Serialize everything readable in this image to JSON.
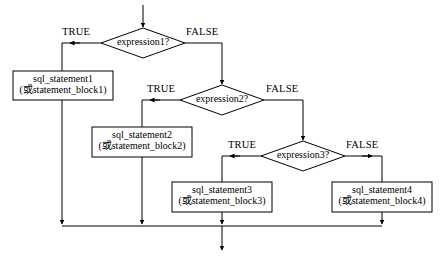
{
  "diagram": {
    "type": "flowchart",
    "title": "",
    "language_note": "或 means \"or\"",
    "entry_arrow": "down-arrow",
    "exit_arrow": "down-arrow"
  },
  "decisions": [
    {
      "id": "d1",
      "label": "expression1?",
      "true_label": "TRUE",
      "false_label": "FALSE"
    },
    {
      "id": "d2",
      "label": "expression2?",
      "true_label": "TRUE",
      "false_label": "FALSE"
    },
    {
      "id": "d3",
      "label": "expression3?",
      "true_label": "TRUE",
      "false_label": "FALSE"
    }
  ],
  "processes": [
    {
      "id": "p1",
      "line1": "sql_statement1",
      "line2": "(或statement_block1)"
    },
    {
      "id": "p2",
      "line1": "sql_statement2",
      "line2": "(或statement_block2)"
    },
    {
      "id": "p3",
      "line1": "sql_statement3",
      "line2": "(或statement_block3)"
    },
    {
      "id": "p4",
      "line1": "sql_statement4",
      "line2": "(或statement_block4)"
    }
  ],
  "colors": {
    "stroke": "#000000",
    "background": "#ffffff",
    "text": "#000000"
  }
}
